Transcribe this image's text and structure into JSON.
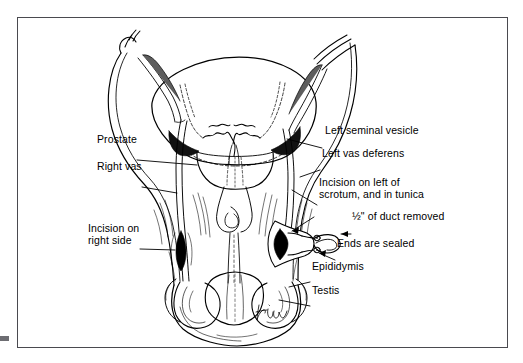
{
  "figure": {
    "line_color": "#000000",
    "frame_color": "#4a4a4f",
    "background": "#ffffff",
    "signature": "artist-signature"
  },
  "labels": [
    {
      "id": "prostate",
      "text": "Prostate",
      "x": 80,
      "y": 139
    },
    {
      "id": "right-vas",
      "text": "Right vas",
      "x": 80,
      "y": 166
    },
    {
      "id": "incision-right",
      "text": "Incision on",
      "x": 83,
      "y": 228
    },
    {
      "id": "incision-right2",
      "text": "right side",
      "x": 83,
      "y": 240
    },
    {
      "id": "left-seminal",
      "text": "Left seminal vesicle",
      "x": 310,
      "y": 127
    },
    {
      "id": "left-vas",
      "text": "Left vas deferens",
      "x": 307,
      "y": 150
    },
    {
      "id": "incision-left",
      "text": "Incision on left of",
      "x": 304,
      "y": 180
    },
    {
      "id": "incision-left2",
      "text": "scrotum, and in tunica",
      "x": 304,
      "y": 192
    },
    {
      "id": "duct-removed",
      "text": "½\" of duct removed",
      "x": 337,
      "y": 213
    },
    {
      "id": "ends-sealed",
      "text": "Ends are sealed",
      "x": 322,
      "y": 240
    },
    {
      "id": "epididymis",
      "text": "Epididymis",
      "x": 297,
      "y": 263
    },
    {
      "id": "testis",
      "text": "Testis",
      "x": 297,
      "y": 287
    }
  ],
  "anatomy_parts": [
    "bladder",
    "right-seminal-vesicle",
    "left-seminal-vesicle",
    "prostate",
    "right-vas-deferens",
    "left-vas-deferens",
    "urethra",
    "penis-shaft",
    "scrotum",
    "right-testis",
    "left-testis",
    "right-epididymis",
    "left-epididymis",
    "right-incision",
    "left-incision",
    "removed-duct-segment",
    "sealed-duct-ends"
  ]
}
